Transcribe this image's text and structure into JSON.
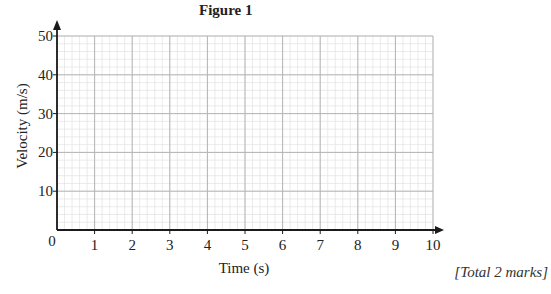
{
  "chart_data": {
    "type": "line",
    "title": "Figure 1",
    "xlabel": "Time (s)",
    "ylabel": "Velocity (m/s)",
    "xlim": [
      0,
      10
    ],
    "ylim": [
      0,
      50
    ],
    "x_ticks": [
      0,
      1,
      2,
      3,
      4,
      5,
      6,
      7,
      8,
      9,
      10
    ],
    "y_ticks": [
      0,
      10,
      20,
      30,
      40,
      50
    ],
    "grid": true,
    "grid_minor_subdivisions": 5,
    "series": [],
    "legend": null
  },
  "footer": {
    "total_marks": "[Total 2 marks]"
  },
  "colors": {
    "axis": "#1a1a1a",
    "major_grid": "#b5b5b5",
    "minor_grid": "#e2e2e2",
    "text": "#222222"
  }
}
